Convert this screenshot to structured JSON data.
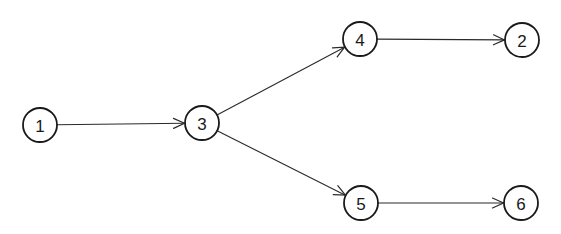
{
  "diagram": {
    "type": "directed-graph",
    "style": {
      "stroke_color": "#1a1a1a",
      "background": "#ffffff",
      "node_radius": 17
    },
    "nodes": [
      {
        "id": "1",
        "label": "1",
        "x": 40,
        "y": 125
      },
      {
        "id": "3",
        "label": "3",
        "x": 202,
        "y": 123
      },
      {
        "id": "4",
        "label": "4",
        "x": 360,
        "y": 39
      },
      {
        "id": "2",
        "label": "2",
        "x": 522,
        "y": 40
      },
      {
        "id": "5",
        "label": "5",
        "x": 361,
        "y": 203
      },
      {
        "id": "6",
        "label": "6",
        "x": 521,
        "y": 203
      }
    ],
    "edges": [
      {
        "from": "1",
        "to": "3"
      },
      {
        "from": "3",
        "to": "4"
      },
      {
        "from": "3",
        "to": "5"
      },
      {
        "from": "4",
        "to": "2"
      },
      {
        "from": "5",
        "to": "6"
      }
    ]
  }
}
